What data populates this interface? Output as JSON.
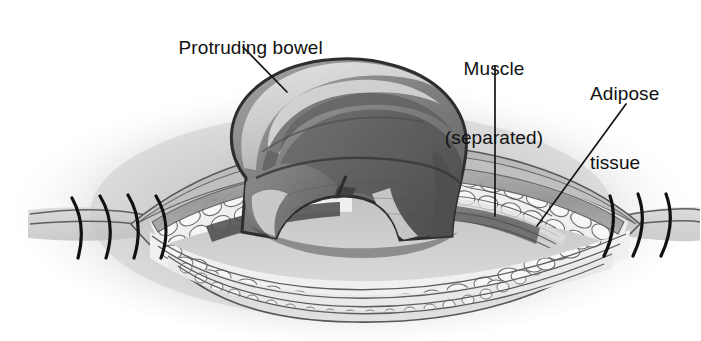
{
  "figure": {
    "kind": "medical-illustration",
    "width": 701,
    "height": 341,
    "background_color": "#ffffff"
  },
  "labels": [
    {
      "id": "protruding-bowel",
      "text": "Protruding bowel",
      "lines": [
        "Protruding bowel"
      ],
      "x": 157,
      "y": 13,
      "leader": {
        "x1": 243,
        "y1": 47,
        "x2": 287,
        "y2": 92
      }
    },
    {
      "id": "muscle-separated",
      "text": "Muscle (separated)",
      "lines": [
        "Muscle",
        "(separated)"
      ],
      "x": 430,
      "y": 11,
      "leader": {
        "x1": 495,
        "y1": 66,
        "x2": 495,
        "y2": 216
      }
    },
    {
      "id": "adipose-tissue",
      "text": "Adipose tissue",
      "lines": [
        "Adipose",
        "tissue"
      ],
      "x": 590,
      "y": 36,
      "leader": {
        "x1": 626,
        "y1": 104,
        "x2": 537,
        "y2": 226
      }
    }
  ],
  "label_text": {
    "protruding_bowel": "Protruding bowel",
    "muscle_line1": "Muscle",
    "muscle_line2": "(separated)",
    "adipose_line1": "Adipose",
    "adipose_line2": "tissue"
  },
  "colors": {
    "ink": "#111111",
    "leader_line": "#151515",
    "halo": "#c9c9c9",
    "skin": "#c3c3c3",
    "skin_light": "#d6d6d6",
    "fat_cell_fill": "#f2f2f2",
    "fat_cell_stroke": "#6f6f6f",
    "muscle_band": "#9a9a9a",
    "fascia_line": "#5d5d5d",
    "bowel_mid": "#8c8c8c",
    "bowel_dark": "#5a5a5a",
    "bowel_darker": "#444444",
    "bowel_highlight": "#d2d2d2",
    "bowel_outline": "#2e2e2e",
    "suture": "#111111"
  },
  "anatomy": {
    "wound": {
      "name": "lens-shaped wound dehiscence",
      "left_apex_x": 131,
      "right_apex_x": 640,
      "center_y": 224
    },
    "layers": [
      {
        "name": "skin-and-halo",
        "description": "soft gray halo of surrounding abdominal skin"
      },
      {
        "name": "adipose-tissue",
        "description": "band of irregular pale fat cells lining the wound"
      },
      {
        "name": "muscle-separated",
        "description": "separated muscle layer with fibrous strands"
      },
      {
        "name": "fascia",
        "description": "thin striated fascial bands beneath the fat"
      },
      {
        "name": "protruding-bowel",
        "description": "large eviscerated bowel mass bulging through the wound"
      }
    ],
    "sutures": {
      "left_count": 4,
      "right_count": 3,
      "description": "intact interrupted sutures flanking the dehisced segment"
    }
  }
}
